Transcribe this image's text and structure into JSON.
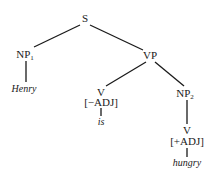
{
  "diagram": {
    "type": "syntax-tree",
    "nodes": {
      "s": {
        "label": "S"
      },
      "np1": {
        "label": "NP",
        "sub": "1"
      },
      "vp": {
        "label": "VP"
      },
      "v1": {
        "label": "V",
        "feature": "[−ADJ]"
      },
      "np2": {
        "label": "NP",
        "sub": "2"
      },
      "v2": {
        "label": "V",
        "feature": "[+ADJ]"
      }
    },
    "words": {
      "henry": "Henry",
      "is": "is",
      "hungry": "hungry"
    },
    "edges": [
      [
        "S",
        "NP1"
      ],
      [
        "S",
        "VP"
      ],
      [
        "NP1",
        "Henry"
      ],
      [
        "VP",
        "V[-ADJ]"
      ],
      [
        "VP",
        "NP2"
      ],
      [
        "V[-ADJ]",
        "is"
      ],
      [
        "NP2",
        "V[+ADJ]"
      ],
      [
        "V[+ADJ]",
        "hungry"
      ]
    ]
  }
}
